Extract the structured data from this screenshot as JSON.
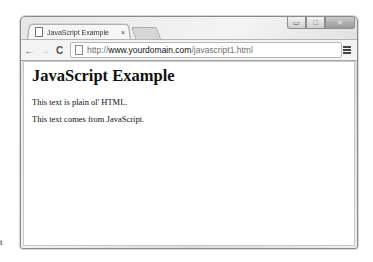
{
  "browser": {
    "tab": {
      "title": "JavaScript Example",
      "close_glyph": "×"
    },
    "window_controls": {
      "minimize": "▭",
      "maximize": "□",
      "close": "✕"
    },
    "toolbar": {
      "back": "←",
      "forward": "→",
      "reload": "C",
      "url": {
        "scheme": "http://",
        "host": "www.yourdomain.com",
        "path": "/javascript1.html"
      }
    }
  },
  "page": {
    "heading": "JavaScript Example",
    "paragraphs": [
      "This text is plain ol' HTML.",
      "This text comes from JavaScript."
    ]
  },
  "stray_text": "t"
}
